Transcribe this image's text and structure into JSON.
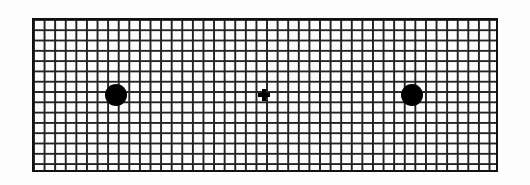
{
  "diagram": {
    "type": "grid-with-markers",
    "grid": {
      "columns": 44,
      "rows": 15,
      "line_color": "#222222",
      "background": "#fdfdfd"
    },
    "markers": [
      {
        "name": "left-dot",
        "shape": "dot",
        "x": 116,
        "y": 95,
        "color": "#000000"
      },
      {
        "name": "center-cross",
        "shape": "cross",
        "x": 264,
        "y": 95,
        "color": "#000000"
      },
      {
        "name": "right-dot",
        "shape": "dot",
        "x": 412,
        "y": 95,
        "color": "#000000"
      }
    ]
  }
}
